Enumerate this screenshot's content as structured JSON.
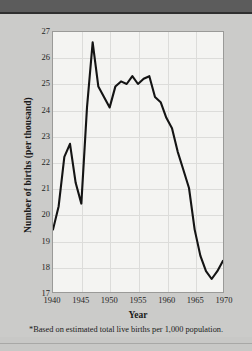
{
  "figure": {
    "annotation": "Birthrate, 1940–1970*",
    "footnote": "*Based on estimated total live births per 1,000 population.",
    "frame_color": "#9a9a98",
    "page_background": "#cbcbc9",
    "header_band_color": "#5c5c5c",
    "plot_background": "#f4f4f2",
    "line_color": "#141414"
  },
  "chart_data": {
    "type": "line",
    "xlabel": "Year",
    "ylabel": "Number of births (per thousand)",
    "xlim": [
      1940,
      1970
    ],
    "ylim": [
      17,
      27
    ],
    "grid": true,
    "legend": "none",
    "xticks": [
      1940,
      1945,
      1950,
      1955,
      1960,
      1965,
      1970
    ],
    "yticks": [
      17,
      18,
      19,
      20,
      21,
      22,
      23,
      24,
      25,
      26,
      27
    ],
    "x": [
      1940,
      1941,
      1942,
      1943,
      1944,
      1945,
      1946,
      1947,
      1948,
      1949,
      1950,
      1951,
      1952,
      1953,
      1954,
      1955,
      1956,
      1957,
      1958,
      1959,
      1960,
      1961,
      1962,
      1963,
      1964,
      1965,
      1966,
      1967,
      1968,
      1969,
      1970
    ],
    "values": [
      19.4,
      20.3,
      22.2,
      22.7,
      21.2,
      20.4,
      24.1,
      26.6,
      24.9,
      24.5,
      24.1,
      24.9,
      25.1,
      25.0,
      25.3,
      25.0,
      25.2,
      25.3,
      24.5,
      24.3,
      23.7,
      23.3,
      22.4,
      21.7,
      21.0,
      19.4,
      18.4,
      17.8,
      17.5,
      17.8,
      18.2
    ],
    "series": [
      {
        "name": "Birthrate",
        "units": "births per 1,000 population",
        "color": "#141414"
      }
    ],
    "annotations": [
      {
        "text": "Birthrate, 1940–1970*",
        "x": 1952,
        "y": 18.9
      }
    ]
  }
}
